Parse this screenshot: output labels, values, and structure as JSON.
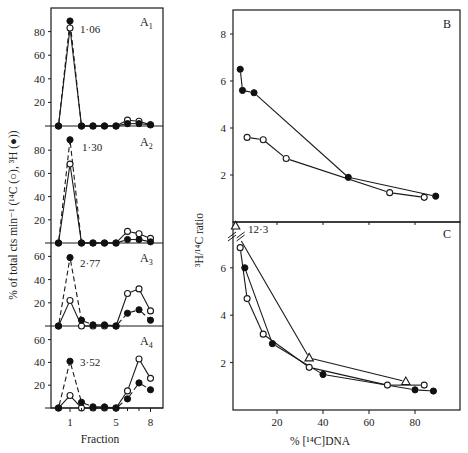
{
  "chart_data": [
    {
      "id": "A1",
      "type": "line",
      "panel_label": "A",
      "panel_sub": "1",
      "annotation": "1·06",
      "xlabel": "",
      "ylabel": "% of total cts min⁻¹ (¹⁴C (○), ³H (●))",
      "x": [
        0,
        1,
        2,
        3,
        4,
        5,
        6,
        7,
        8
      ],
      "yticks": [
        20,
        40,
        60,
        80
      ],
      "ylim": [
        0,
        100
      ],
      "series": [
        {
          "name": "14C (open circles)",
          "marker": "open",
          "line": "solid",
          "values": [
            0,
            83,
            0,
            0,
            0,
            0,
            5,
            4,
            1
          ]
        },
        {
          "name": "3H (filled circles)",
          "marker": "filled",
          "line": "dashed",
          "values": [
            0,
            89,
            0,
            0,
            0,
            0,
            2,
            2,
            1
          ]
        }
      ]
    },
    {
      "id": "A2",
      "type": "line",
      "panel_label": "A",
      "panel_sub": "2",
      "annotation": "1·30",
      "x": [
        0,
        1,
        2,
        3,
        4,
        5,
        6,
        7,
        8
      ],
      "yticks": [
        20,
        40,
        60,
        80
      ],
      "ylim": [
        0,
        100
      ],
      "series": [
        {
          "name": "14C (open circles)",
          "marker": "open",
          "line": "solid",
          "values": [
            0,
            68,
            0,
            0,
            0,
            0,
            10,
            8,
            4
          ]
        },
        {
          "name": "3H (filled circles)",
          "marker": "filled",
          "line": "dashed",
          "values": [
            0,
            89,
            0,
            0,
            0,
            0,
            3,
            3,
            1
          ]
        }
      ]
    },
    {
      "id": "A3",
      "type": "line",
      "panel_label": "A",
      "panel_sub": "3",
      "annotation": "2·77",
      "x": [
        0,
        1,
        2,
        3,
        4,
        5,
        6,
        7,
        8
      ],
      "yticks": [
        20,
        40,
        60
      ],
      "ylim": [
        0,
        70
      ],
      "series": [
        {
          "name": "14C (open circles)",
          "marker": "open",
          "line": "solid",
          "values": [
            0,
            22,
            0,
            0,
            0,
            0,
            28,
            32,
            13
          ]
        },
        {
          "name": "3H (filled circles)",
          "marker": "filled",
          "line": "dashed",
          "values": [
            0,
            59,
            5,
            1,
            1,
            0,
            11,
            14,
            5
          ]
        }
      ]
    },
    {
      "id": "A4",
      "type": "line",
      "panel_label": "A",
      "panel_sub": "4",
      "annotation": "3·52",
      "xlabel": "Fraction",
      "x": [
        0,
        1,
        2,
        3,
        4,
        5,
        6,
        7,
        8
      ],
      "xticks": [
        1,
        5,
        8
      ],
      "yticks": [
        20,
        40,
        60
      ],
      "ylim": [
        0,
        70
      ],
      "series": [
        {
          "name": "14C (open circles)",
          "marker": "open",
          "line": "solid",
          "values": [
            0,
            11,
            0,
            0,
            0,
            0,
            15,
            43,
            26
          ]
        },
        {
          "name": "3H (filled circles)",
          "marker": "filled",
          "line": "dashed",
          "values": [
            0,
            41,
            5,
            1,
            1,
            0,
            8,
            22,
            16
          ]
        }
      ]
    },
    {
      "id": "B",
      "type": "line",
      "panel_label": "B",
      "ylabel": "³H/¹⁴C ratio",
      "xlim": [
        0,
        100
      ],
      "ylim": [
        0,
        9
      ],
      "yticks": [
        2,
        4,
        6,
        8
      ],
      "series": [
        {
          "name": "filled circles",
          "marker": "filled",
          "line": "solid",
          "points": [
            [
              4,
              6.5
            ],
            [
              5,
              5.6
            ],
            [
              10,
              5.5
            ],
            [
              51,
              1.9
            ],
            [
              89,
              1.1
            ]
          ]
        },
        {
          "name": "open circles",
          "marker": "open",
          "line": "solid",
          "points": [
            [
              7,
              3.6
            ],
            [
              14,
              3.5
            ],
            [
              24,
              2.7
            ],
            [
              69,
              1.25
            ],
            [
              84,
              1.05
            ]
          ]
        }
      ]
    },
    {
      "id": "C",
      "type": "line",
      "panel_label": "C",
      "xlabel": "% [¹⁴C]DNA",
      "ylabel": "³H/¹⁴C ratio",
      "xlim": [
        0,
        100
      ],
      "ylim": [
        0,
        8
      ],
      "xticks": [
        20,
        40,
        60,
        80
      ],
      "yticks": [
        2,
        4,
        6
      ],
      "annotation": "12·3",
      "series": [
        {
          "name": "triangles",
          "marker": "triangle",
          "line": "solid",
          "points": [
            [
              2,
              12.3
            ],
            [
              34,
              2.2
            ],
            [
              76,
              1.2
            ]
          ],
          "off_scale_point_label": "12·3"
        },
        {
          "name": "open circles",
          "marker": "open",
          "line": "solid",
          "points": [
            [
              4,
              6.85
            ],
            [
              7,
              4.7
            ],
            [
              14,
              3.2
            ],
            [
              34,
              1.8
            ],
            [
              68,
              1.05
            ],
            [
              84,
              1.05
            ]
          ]
        },
        {
          "name": "filled circles",
          "marker": "filled",
          "line": "solid",
          "points": [
            [
              6,
              6.0
            ],
            [
              18,
              2.8
            ],
            [
              40,
              1.5
            ],
            [
              80,
              0.85
            ],
            [
              88,
              0.8
            ]
          ]
        }
      ]
    }
  ],
  "labels": {
    "left_ylabel": "% of total cts min⁻¹ (¹⁴C (○), ³H (●))",
    "left_xlabel": "Fraction",
    "right_ylabel": "³H/¹⁴C ratio",
    "right_xlabel": "% [¹⁴C]DNA",
    "panel_B": "B",
    "panel_C": "C",
    "panel_A1": "A",
    "panel_A1_sub": "1",
    "panel_A2": "A",
    "panel_A2_sub": "2",
    "panel_A3": "A",
    "panel_A3_sub": "3",
    "panel_A4": "A",
    "panel_A4_sub": "4",
    "annot_A1": "1·06",
    "annot_A2": "1·30",
    "annot_A3": "2·77",
    "annot_A4": "3·52",
    "annot_C": "12·3"
  }
}
